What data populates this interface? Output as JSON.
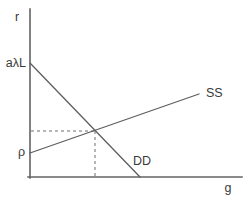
{
  "chart_data": {
    "type": "line",
    "xlabel": "g",
    "ylabel": "r",
    "style": {
      "background": "#ffffff",
      "axis_color": "#636363",
      "line_color": "#5e5e5e",
      "guide_color": "#6e6e6e",
      "text_color": "#3a3a3a"
    },
    "canvas": {
      "width": 246,
      "height": 204
    },
    "axes": {
      "y": {
        "x1": 30,
        "y1": 9,
        "x2": 30,
        "y2": 178,
        "label": "r",
        "label_x": 17,
        "label_y": 21
      },
      "x": {
        "x1": 28,
        "y1": 177,
        "x2": 242,
        "y2": 177,
        "label": "g",
        "label_x": 228,
        "label_y": 192
      }
    },
    "series": [
      {
        "name": "DD",
        "label": "DD",
        "slope": "negative",
        "y_intercept_label": "aλL",
        "x1": 30,
        "y1": 63,
        "x2": 140,
        "y2": 177,
        "label_x": 133,
        "label_y": 165,
        "intercept_label_x": 26,
        "intercept_label_y": 67
      },
      {
        "name": "SS",
        "label": "SS",
        "slope": "positive",
        "y_intercept_label": "ρ",
        "x1": 30,
        "y1": 153,
        "x2": 199,
        "y2": 94,
        "label_x": 206,
        "label_y": 97,
        "intercept_label_x": 25,
        "intercept_label_y": 156
      }
    ],
    "equilibrium": {
      "x": 95,
      "y": 131
    },
    "guides": [
      {
        "x1": 31,
        "y1": 131,
        "x2": 95,
        "y2": 131
      },
      {
        "x1": 95,
        "y1": 131,
        "x2": 95,
        "y2": 176
      }
    ]
  }
}
